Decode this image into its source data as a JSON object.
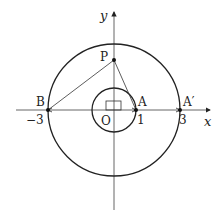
{
  "diagram": {
    "axes": {
      "x_label": "x",
      "y_label": "y",
      "origin_label": "O"
    },
    "ticks": {
      "neg3": "−3",
      "pos1": "1",
      "pos3": "3"
    },
    "points": {
      "P": "P",
      "A": "A",
      "A_prime": "A′",
      "B": "B"
    },
    "circles": [
      {
        "name": "inner",
        "center": "O",
        "radius": 1
      },
      {
        "name": "outer",
        "center": "O",
        "radius": 3
      }
    ],
    "segments": [
      "PB",
      "PA"
    ],
    "right_angle_marker": "at O",
    "colors": {
      "stroke": "#222222",
      "axis": "#555555",
      "background": "#ffffff"
    }
  }
}
